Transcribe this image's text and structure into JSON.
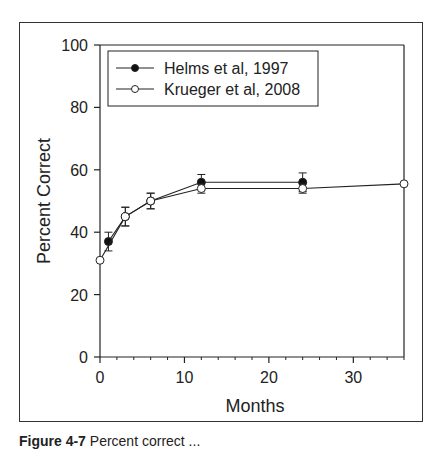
{
  "chart_data": {
    "type": "line",
    "title": "",
    "xlabel": "Months",
    "ylabel": "Percent Correct",
    "xlim": [
      0,
      36
    ],
    "ylim": [
      0,
      100
    ],
    "xticks": [
      0,
      10,
      20,
      30
    ],
    "yticks": [
      0,
      20,
      40,
      60,
      80,
      100
    ],
    "x_minor_step": 2,
    "grid": false,
    "legend_position": "upper left",
    "series": [
      {
        "name": "Helms et al, 1997",
        "marker": "filled-circle",
        "x": [
          1,
          3,
          6,
          12,
          24
        ],
        "y": [
          37,
          45,
          50,
          56,
          56
        ],
        "err": [
          3,
          3,
          2.5,
          2.5,
          3
        ]
      },
      {
        "name": "Krueger et al, 2008",
        "marker": "open-circle",
        "x": [
          0,
          3,
          6,
          12,
          24,
          36
        ],
        "y": [
          31,
          45,
          50,
          54,
          54,
          55.5
        ],
        "err": [
          0,
          3,
          2.5,
          1.5,
          1.5,
          0
        ]
      }
    ]
  },
  "caption": {
    "label": "Figure 4-7",
    "text": "Percent correct ..."
  }
}
